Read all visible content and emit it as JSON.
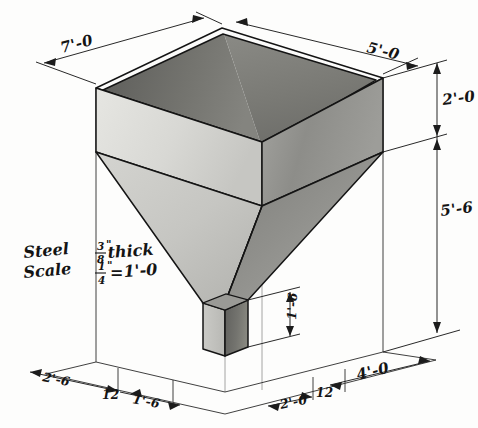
{
  "drawing": {
    "title": "Steel Hopper — Isometric",
    "object": "rectangular steel hopper with tapered funnel and square spout",
    "projection": "isometric",
    "line_color": "#141414",
    "paper_color": "#fdfdfc"
  },
  "notes": {
    "material_label": "Steel",
    "material_thickness_num": "3",
    "material_thickness_den": "8",
    "material_thickness_unit": "\"",
    "material_thickness_word": "thick",
    "scale_label": "Scale",
    "scale_num": "1",
    "scale_den": "4",
    "scale_unit": "\"",
    "scale_equals": "=",
    "scale_value": "1'-0"
  },
  "dimensions": {
    "top_left_width": "7'-0",
    "top_right_width": "5'-0",
    "upper_body_height": "2'-0",
    "taper_height": "5'-6",
    "spout_height": "1'-6",
    "ground_left_a": "2'-6",
    "ground_left_tick": "12",
    "ground_left_b": "1'-6",
    "ground_right_a": "2'-0",
    "ground_right_tick": "12",
    "ground_right_b": "4'-0"
  },
  "shading": {
    "top_rim": "#fbfbfa",
    "left_outer": "#d6d6d2",
    "right_outer": "#8e8e8a",
    "interior_back_left": "#6b6b68",
    "interior_back_right": "#7e7e7a",
    "taper_left": "#c9c9c5",
    "taper_right": "#8a8a86",
    "spout_left": "#c2c2be",
    "spout_right": "#6d6d6a"
  }
}
